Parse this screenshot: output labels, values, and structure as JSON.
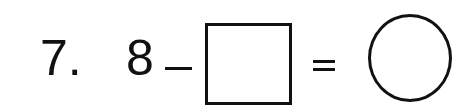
{
  "problem": {
    "number_label": "7.",
    "minuend": "8",
    "operator": "−",
    "equals": "=",
    "blank_box": "",
    "answer_circle": ""
  }
}
